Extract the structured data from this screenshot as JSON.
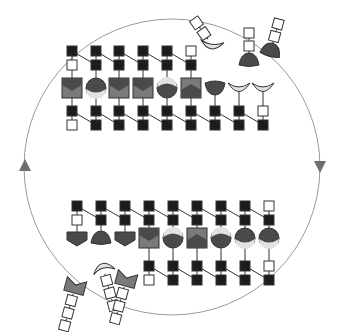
{
  "diagram": {
    "type": "cyclic-assembly-diagram",
    "colors": {
      "background": "#ffffff",
      "cycle_line": "#9a9a9a",
      "arrow": "#6e6e6e",
      "black_block": "#1c1c1c",
      "white_block": "#ffffff",
      "block_stroke": "#333333",
      "dark_fill": "#4a4a4a",
      "mid_fill": "#7a7a7a",
      "light_fill": "#e2e2e2",
      "connector": "#333333"
    },
    "cycle": {
      "cx": 172,
      "cy": 167,
      "r": 148,
      "arrows": [
        {
          "name": "arrow-up-left",
          "direction": "up",
          "x": 25,
          "y": 166
        },
        {
          "name": "arrow-down-right",
          "direction": "down",
          "x": 320,
          "y": 166
        }
      ]
    },
    "top_row": {
      "y_top": 51,
      "y_second": 65,
      "y_shape": 88,
      "y_lower": 111,
      "y_bottom": 125,
      "units": [
        {
          "x": 72,
          "top": [
            "black",
            "white"
          ],
          "shape": "square-chevron",
          "bottom": [
            "black",
            "white"
          ]
        },
        {
          "x": 96,
          "top": [
            "black",
            "black"
          ],
          "shape": "circle-lower-light",
          "bottom": [
            "black",
            "black"
          ]
        },
        {
          "x": 119,
          "top": [
            "black",
            "black"
          ],
          "shape": "square-chevron",
          "bottom": [
            "black",
            "black"
          ]
        },
        {
          "x": 143,
          "top": [
            "black",
            "black"
          ],
          "shape": "square-chevron",
          "bottom": [
            "black",
            "black"
          ]
        },
        {
          "x": 167,
          "top": [
            "black",
            "black"
          ],
          "shape": "circle-upper-light",
          "bottom": [
            "black",
            "black"
          ]
        },
        {
          "x": 191,
          "top": [
            "white",
            "black"
          ],
          "shape": "square-mountain",
          "bottom": [
            "black",
            "black"
          ]
        },
        {
          "x": 215,
          "top": [],
          "shape": "dome-down",
          "bottom": [
            "black",
            "black"
          ]
        },
        {
          "x": 239,
          "top": [],
          "shape": "crescent-light",
          "bottom": [
            "black",
            "black"
          ]
        },
        {
          "x": 263,
          "top": [],
          "shape": "crescent-light",
          "bottom": [
            "white",
            "black"
          ]
        }
      ]
    },
    "top_free_pieces": [
      {
        "x": 212,
        "y": 45,
        "shape": "crescent-light-tilted",
        "tail": [
          "white",
          "white"
        ],
        "angle": -35
      },
      {
        "x": 249,
        "y": 60,
        "shape": "dome-up",
        "tail": [
          "white",
          "white"
        ],
        "angle": 0
      },
      {
        "x": 271,
        "y": 50,
        "shape": "dome-up",
        "tail": [
          "white",
          "white"
        ],
        "angle": 15
      }
    ],
    "bottom_row": {
      "y_top": 206,
      "y_second": 220,
      "y_shape": 238,
      "y_lower": 266,
      "y_bottom": 280,
      "units": [
        {
          "x": 77,
          "top": [
            "black",
            "white"
          ],
          "shape": "pentagon-down",
          "bottom": []
        },
        {
          "x": 101,
          "top": [
            "black",
            "black"
          ],
          "shape": "dome-up",
          "bottom": []
        },
        {
          "x": 125,
          "top": [
            "black",
            "black"
          ],
          "shape": "pentagon-down",
          "bottom": []
        },
        {
          "x": 149,
          "top": [
            "black",
            "black"
          ],
          "shape": "square-chevron",
          "bottom": [
            "black",
            "white"
          ]
        },
        {
          "x": 173,
          "top": [
            "black",
            "black"
          ],
          "shape": "circle-upper-light",
          "bottom": [
            "black",
            "black"
          ]
        },
        {
          "x": 197,
          "top": [
            "black",
            "black"
          ],
          "shape": "square-mountain",
          "bottom": [
            "black",
            "black"
          ]
        },
        {
          "x": 221,
          "top": [
            "black",
            "black"
          ],
          "shape": "circle-upper-light",
          "bottom": [
            "black",
            "black"
          ]
        },
        {
          "x": 245,
          "top": [
            "black",
            "black"
          ],
          "shape": "circle-lower-light",
          "bottom": [
            "black",
            "black"
          ]
        },
        {
          "x": 269,
          "top": [
            "white",
            "black"
          ],
          "shape": "circle-lower-light",
          "bottom": [
            "white",
            "black"
          ]
        }
      ]
    },
    "bottom_free_pieces": [
      {
        "x": 75,
        "y": 287,
        "shape": "bowtie-mid",
        "tail": [
          "white",
          "white",
          "white"
        ],
        "angle": 15
      },
      {
        "x": 103,
        "y": 267,
        "shape": "crescent-light-up",
        "tail": [
          "white",
          "white",
          "white"
        ],
        "angle": -15
      },
      {
        "x": 126,
        "y": 280,
        "shape": "bowtie-mid",
        "tail": [
          "white",
          "white",
          "white"
        ],
        "angle": 15
      }
    ]
  }
}
